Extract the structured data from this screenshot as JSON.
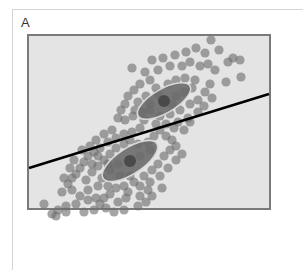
{
  "panel": {
    "label": "A"
  },
  "chart_data": {
    "type": "scatter",
    "title": "",
    "xlabel": "",
    "ylabel": "",
    "grid": false,
    "legend": null,
    "colors": {
      "background": "#e4e4e4",
      "frame": "#7a7a7a",
      "point": "#6e6e6e",
      "ellipse_fill": "#6a6a6a",
      "ellipse_stroke": "#d8d8d8",
      "center": "#4a4a4a",
      "line": "#000000"
    },
    "clusters": [
      {
        "name": "upper",
        "center": [
          164,
          101
        ],
        "ellipse": {
          "rx": 30,
          "ry": 12,
          "angle": -30
        }
      },
      {
        "name": "lower",
        "center": [
          130,
          161
        ],
        "ellipse": {
          "rx": 32,
          "ry": 13,
          "angle": -33
        }
      }
    ],
    "boundary_line": {
      "x1": 29,
      "y1": 168,
      "x2": 269,
      "y2": 94
    },
    "points": [
      [
        132,
        68
      ],
      [
        145,
        72
      ],
      [
        152,
        60
      ],
      [
        163,
        58
      ],
      [
        175,
        55
      ],
      [
        186,
        52
      ],
      [
        196,
        48
      ],
      [
        205,
        53
      ],
      [
        211,
        40
      ],
      [
        219,
        50
      ],
      [
        228,
        62
      ],
      [
        233,
        58
      ],
      [
        240,
        60
      ],
      [
        241,
        77
      ],
      [
        226,
        82
      ],
      [
        215,
        70
      ],
      [
        208,
        64
      ],
      [
        200,
        66
      ],
      [
        190,
        62
      ],
      [
        182,
        66
      ],
      [
        170,
        66
      ],
      [
        158,
        70
      ],
      [
        150,
        80
      ],
      [
        140,
        84
      ],
      [
        134,
        90
      ],
      [
        128,
        96
      ],
      [
        125,
        104
      ],
      [
        121,
        110
      ],
      [
        118,
        118
      ],
      [
        125,
        120
      ],
      [
        133,
        116
      ],
      [
        142,
        112
      ],
      [
        150,
        110
      ],
      [
        160,
        116
      ],
      [
        170,
        114
      ],
      [
        180,
        110
      ],
      [
        190,
        104
      ],
      [
        198,
        100
      ],
      [
        205,
        92
      ],
      [
        210,
        84
      ],
      [
        195,
        80
      ],
      [
        185,
        78
      ],
      [
        176,
        80
      ],
      [
        168,
        84
      ],
      [
        156,
        88
      ],
      [
        146,
        96
      ],
      [
        138,
        102
      ],
      [
        135,
        110
      ],
      [
        144,
        120
      ],
      [
        156,
        124
      ],
      [
        166,
        124
      ],
      [
        178,
        122
      ],
      [
        188,
        118
      ],
      [
        198,
        112
      ],
      [
        204,
        106
      ],
      [
        212,
        98
      ],
      [
        184,
        92
      ],
      [
        192,
        88
      ],
      [
        176,
        96
      ],
      [
        172,
        104
      ],
      [
        150,
        104
      ],
      [
        158,
        94
      ],
      [
        140,
        128
      ],
      [
        132,
        132
      ],
      [
        124,
        134
      ],
      [
        116,
        138
      ],
      [
        108,
        142
      ],
      [
        100,
        148
      ],
      [
        94,
        152
      ],
      [
        88,
        156
      ],
      [
        84,
        162
      ],
      [
        80,
        168
      ],
      [
        76,
        174
      ],
      [
        72,
        178
      ],
      [
        68,
        184
      ],
      [
        72,
        190
      ],
      [
        80,
        196
      ],
      [
        76,
        204
      ],
      [
        66,
        206
      ],
      [
        58,
        210
      ],
      [
        52,
        214
      ],
      [
        44,
        204
      ],
      [
        56,
        216
      ],
      [
        66,
        212
      ],
      [
        84,
        212
      ],
      [
        94,
        210
      ],
      [
        100,
        204
      ],
      [
        104,
        198
      ],
      [
        110,
        194
      ],
      [
        116,
        188
      ],
      [
        124,
        186
      ],
      [
        134,
        182
      ],
      [
        140,
        186
      ],
      [
        148,
        190
      ],
      [
        152,
        196
      ],
      [
        146,
        202
      ],
      [
        138,
        206
      ],
      [
        126,
        198
      ],
      [
        118,
        202
      ],
      [
        106,
        208
      ],
      [
        96,
        198
      ],
      [
        88,
        190
      ],
      [
        86,
        180
      ],
      [
        92,
        172
      ],
      [
        98,
        166
      ],
      [
        104,
        160
      ],
      [
        110,
        154
      ],
      [
        116,
        148
      ],
      [
        124,
        144
      ],
      [
        130,
        140
      ],
      [
        138,
        144
      ],
      [
        148,
        142
      ],
      [
        154,
        136
      ],
      [
        160,
        130
      ],
      [
        166,
        136
      ],
      [
        172,
        140
      ],
      [
        176,
        146
      ],
      [
        170,
        150
      ],
      [
        164,
        156
      ],
      [
        158,
        164
      ],
      [
        152,
        170
      ],
      [
        144,
        176
      ],
      [
        130,
        176
      ],
      [
        120,
        176
      ],
      [
        110,
        170
      ],
      [
        102,
        178
      ],
      [
        98,
        186
      ],
      [
        108,
        186
      ],
      [
        160,
        176
      ],
      [
        168,
        168
      ],
      [
        176,
        160
      ],
      [
        182,
        154
      ],
      [
        174,
        128
      ],
      [
        184,
        130
      ],
      [
        190,
        122
      ],
      [
        150,
        150
      ],
      [
        140,
        156
      ],
      [
        112,
        130
      ],
      [
        104,
        134
      ],
      [
        96,
        140
      ],
      [
        90,
        146
      ],
      [
        82,
        150
      ],
      [
        74,
        160
      ],
      [
        70,
        168
      ],
      [
        64,
        178
      ],
      [
        62,
        192
      ],
      [
        88,
        200
      ],
      [
        114,
        212
      ],
      [
        124,
        210
      ],
      [
        140,
        196
      ],
      [
        150,
        182
      ],
      [
        162,
        188
      ],
      [
        128,
        192
      ],
      [
        118,
        164
      ],
      [
        108,
        164
      ],
      [
        98,
        156
      ],
      [
        92,
        164
      ]
    ]
  }
}
